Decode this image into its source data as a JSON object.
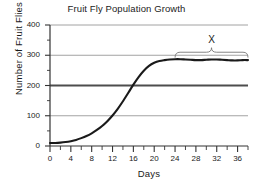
{
  "chart_data": {
    "type": "line",
    "title": "Fruit Fly Population Growth",
    "xlabel": "Days",
    "ylabel": "Number of Fruit Flies",
    "xlim": [
      0,
      38
    ],
    "ylim": [
      0,
      400
    ],
    "grid": true,
    "legend": "none",
    "x_ticks": [
      0,
      4,
      8,
      12,
      16,
      20,
      24,
      28,
      32,
      36
    ],
    "x_tick_labels": [
      "0",
      "4",
      "8",
      "12",
      "16",
      "20",
      "24",
      "28",
      "32",
      "36"
    ],
    "x_minor_tick_interval": 2,
    "y_ticks": [
      0,
      100,
      200,
      300,
      400
    ],
    "y_tick_labels": [
      "0",
      "100",
      "200",
      "300",
      "400"
    ],
    "y_minor_tick_interval": 50,
    "gridlines": [
      100,
      200,
      300,
      400
    ],
    "emphasized_gridline": 200,
    "series": [
      {
        "name": "Fruit fly population",
        "color": "#1a1a1a",
        "x": [
          0,
          1,
          2,
          3,
          4,
          5,
          6,
          7,
          8,
          9,
          10,
          11,
          12,
          13,
          14,
          15,
          16,
          17,
          18,
          19,
          20,
          21,
          22,
          23,
          24,
          25,
          26,
          27,
          28,
          29,
          30,
          31,
          32,
          33,
          34,
          35,
          36,
          37,
          38
        ],
        "values": [
          10,
          10,
          11,
          13,
          16,
          20,
          26,
          33,
          42,
          53,
          66,
          82,
          101,
          123,
          148,
          175,
          203,
          228,
          249,
          265,
          275,
          281,
          284,
          286,
          287,
          287,
          286,
          285,
          284,
          284,
          285,
          286,
          286,
          285,
          284,
          283,
          283,
          284,
          284
        ]
      }
    ],
    "annotations": [
      {
        "label": "X",
        "type": "brace",
        "x_start": 24,
        "x_end": 38,
        "y": 310,
        "description": "Brace spanning the plateau phase of the growth curve"
      }
    ]
  },
  "axis": {
    "y_labels": [
      "400",
      "300",
      "200",
      "100",
      "0"
    ],
    "x_labels": [
      "0",
      "4",
      "8",
      "12",
      "16",
      "20",
      "24",
      "28",
      "32",
      "36"
    ]
  },
  "colors": {
    "curve": "#1a1a1a",
    "gridline": "#8c8c8c",
    "gridline_emphasis": "#4d4d4d",
    "axis": "#333333",
    "background": "#ffffff"
  }
}
